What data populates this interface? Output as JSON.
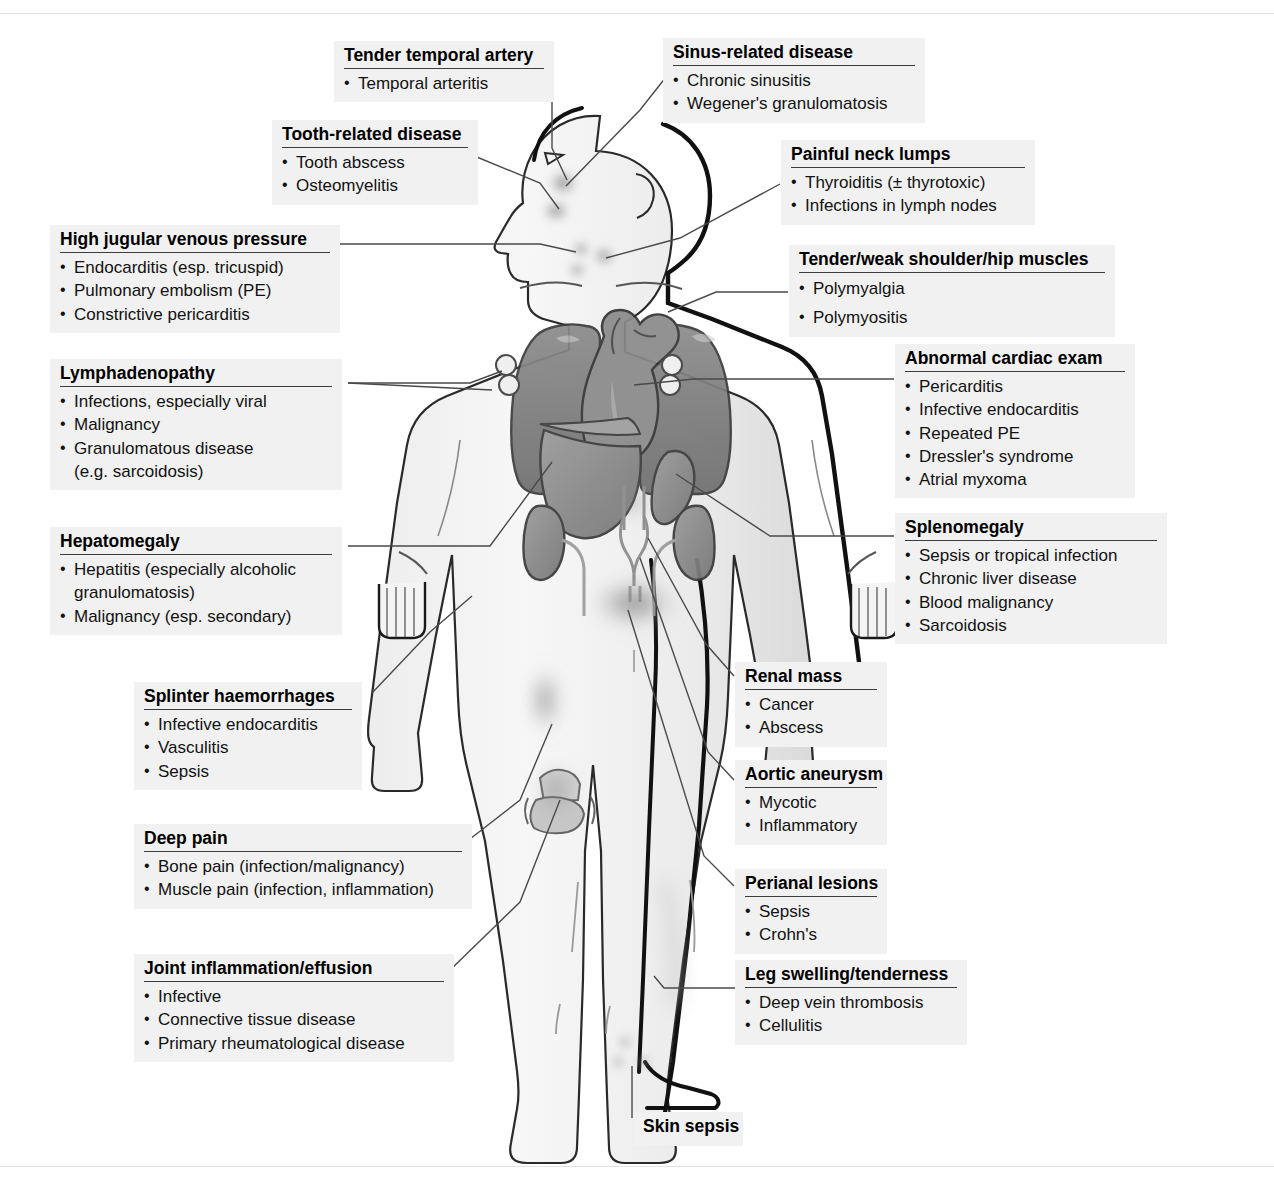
{
  "diagram": {
    "type": "anatomical-labelled-figure",
    "figure_parts": [
      "head-profile",
      "neck",
      "torso",
      "arms",
      "hands",
      "legs",
      "feet",
      "lungs",
      "heart",
      "liver",
      "spleen",
      "kidneys",
      "ureters",
      "aorta",
      "axillary-lymph-nodes",
      "cervical-lymph-nodes",
      "knee-joint"
    ]
  },
  "labels": [
    {
      "id": "tender-temporal-artery",
      "heading": "Tender temporal artery",
      "items": [
        "Temporal arteritis"
      ]
    },
    {
      "id": "sinus-related-disease",
      "heading": "Sinus-related disease",
      "items": [
        "Chronic sinusitis",
        "Wegener's granulomatosis"
      ]
    },
    {
      "id": "tooth-related-disease",
      "heading": "Tooth-related disease",
      "items": [
        "Tooth abscess",
        "Osteomyelitis"
      ]
    },
    {
      "id": "painful-neck-lumps",
      "heading": "Painful neck lumps",
      "items": [
        "Thyroiditis (± thyrotoxic)",
        "Infections in lymph nodes"
      ]
    },
    {
      "id": "high-jugular-venous-pressure",
      "heading": "High jugular venous pressure",
      "items": [
        "Endocarditis (esp. tricuspid)",
        "Pulmonary embolism (PE)",
        "Constrictive pericarditis"
      ]
    },
    {
      "id": "tender-weak-shoulder-hip-muscles",
      "heading": "Tender/weak shoulder/hip muscles",
      "items": [
        "Polymyalgia",
        "Polymyositis"
      ]
    },
    {
      "id": "lymphadenopathy",
      "heading": "Lymphadenopathy",
      "items": [
        "Infections, especially viral",
        "Malignancy",
        "Granulomatous disease",
        "(e.g. sarcoidosis)"
      ]
    },
    {
      "id": "abnormal-cardiac-exam",
      "heading": "Abnormal cardiac exam",
      "items": [
        "Pericarditis",
        "Infective endocarditis",
        "Repeated PE",
        "Dressler's syndrome",
        "Atrial myxoma"
      ]
    },
    {
      "id": "hepatomegaly",
      "heading": "Hepatomegaly",
      "items": [
        "Hepatitis (especially alcoholic",
        "granulomatosis)",
        "Malignancy (esp. secondary)"
      ]
    },
    {
      "id": "splenomegaly",
      "heading": "Splenomegaly",
      "items": [
        "Sepsis or tropical infection",
        "Chronic liver disease",
        "Blood malignancy",
        "Sarcoidosis"
      ]
    },
    {
      "id": "splinter-haemorrhages",
      "heading": "Splinter haemorrhages",
      "items": [
        "Infective endocarditis",
        "Vasculitis",
        "Sepsis"
      ]
    },
    {
      "id": "renal-mass",
      "heading": "Renal mass",
      "items": [
        "Cancer",
        "Abscess"
      ]
    },
    {
      "id": "aortic-aneurysm",
      "heading": "Aortic aneurysm",
      "items": [
        "Mycotic",
        "Inflammatory"
      ]
    },
    {
      "id": "deep-pain",
      "heading": "Deep pain",
      "items": [
        "Bone pain (infection/malignancy)",
        "Muscle pain (infection, inflammation)"
      ]
    },
    {
      "id": "perianal-lesions",
      "heading": "Perianal lesions",
      "items": [
        "Sepsis",
        "Crohn's"
      ]
    },
    {
      "id": "joint-inflammation-effusion",
      "heading": "Joint inflammation/effusion",
      "items": [
        "Infective",
        "Connective tissue disease",
        "Primary rheumatological disease"
      ]
    },
    {
      "id": "leg-swelling-tenderness",
      "heading": "Leg swelling/tenderness",
      "items": [
        "Deep vein thrombosis",
        "Cellulitis"
      ]
    },
    {
      "id": "skin-sepsis",
      "heading": "Skin sepsis",
      "items": []
    }
  ],
  "colors": {
    "label_background": "#f1f1f1",
    "heading_rule": "#3c3c3c",
    "text": "#111111",
    "leader_line": "#4a4a4a",
    "body_fill": "#f2f2f2",
    "body_outline": "#1a1a1a",
    "organ_dark": "#7b7b7b",
    "organ_mid": "#8e8e8e",
    "organ_light": "#a8a8a8",
    "blur_spot": "#9a9a9a",
    "frame": "#e3e3e3"
  }
}
